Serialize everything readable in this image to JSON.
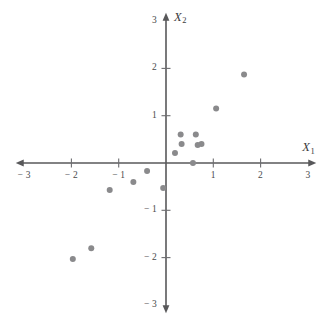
{
  "chart_data": {
    "type": "scatter",
    "title": "",
    "xlabel": "X1",
    "ylabel": "X2",
    "xlabel_display": "X",
    "xlabel_sub": "1",
    "ylabel_display": "X",
    "ylabel_sub": "2",
    "xlim": [
      -3,
      3
    ],
    "ylim": [
      -3,
      3
    ],
    "grid": false,
    "legend": null,
    "xticks": [
      -3,
      -2,
      -1,
      1,
      2,
      3
    ],
    "yticks": [
      -3,
      -2,
      -1,
      1,
      2,
      3
    ],
    "xtick_labels": [
      "− 3",
      "− 2",
      "− 1",
      "1",
      "2",
      "3"
    ],
    "ytick_labels": [
      "− 3",
      "− 2",
      "− 1",
      "1",
      "2",
      "3"
    ],
    "point_color": "#8a8a8c",
    "axis_color": "#58585a",
    "point_radius": 3.0,
    "n_points": 15,
    "points": [
      {
        "x": 1.65,
        "y": 1.87
      },
      {
        "x": 1.06,
        "y": 1.15
      },
      {
        "x": 0.31,
        "y": 0.6
      },
      {
        "x": 0.63,
        "y": 0.6
      },
      {
        "x": 0.33,
        "y": 0.4
      },
      {
        "x": 0.75,
        "y": 0.4
      },
      {
        "x": 0.67,
        "y": 0.38
      },
      {
        "x": 0.19,
        "y": 0.21
      },
      {
        "x": 0.57,
        "y": 0.0
      },
      {
        "x": -0.4,
        "y": -0.17
      },
      {
        "x": -0.69,
        "y": -0.4
      },
      {
        "x": -0.06,
        "y": -0.53
      },
      {
        "x": -1.19,
        "y": -0.57
      },
      {
        "x": -1.58,
        "y": -1.8
      },
      {
        "x": -1.97,
        "y": -2.03
      }
    ]
  },
  "geometry": {
    "origin_x": 166,
    "origin_y": 163,
    "unit_px": 47.3,
    "axis_extent": 3.05
  }
}
